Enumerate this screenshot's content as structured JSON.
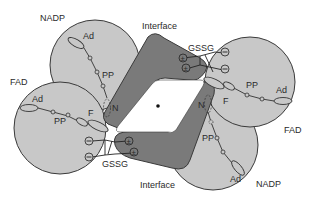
{
  "diagram": {
    "type": "molecular-structure-schematic",
    "colors": {
      "background": "#ffffff",
      "domain_fill": "#c8c8c8",
      "interface_fill": "#7a7a7a",
      "outline": "#3a3a3a",
      "text": "#2a2a2a"
    },
    "labels": {
      "nadp_top": "NADP",
      "nadp_bottom": "NADP",
      "fad_left": "FAD",
      "fad_right": "FAD",
      "interface_top": "Interface",
      "interface_bottom": "Interface",
      "gssg_top": "GSSG",
      "gssg_bottom": "GSSG",
      "ad_nadp_top": "Ad",
      "pp_nadp_top": "PP",
      "ad_fad_left": "Ad",
      "pp_fad_left": "PP",
      "f_left": "F",
      "n_left": "N",
      "ad_fad_right": "Ad",
      "pp_fad_right": "PP",
      "f_right": "F",
      "n_right": "N",
      "ad_nadp_bottom": "Ad",
      "pp_nadp_bottom": "PP"
    },
    "charges": {
      "plus_minus": "±",
      "minus": "−"
    }
  }
}
